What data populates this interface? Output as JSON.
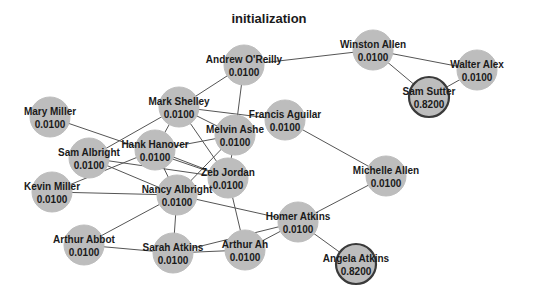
{
  "title": "initialization",
  "colors": {
    "node_fill": "#bdbdbd",
    "node_highlight_border": "#3a3a3a",
    "edge": "#555555",
    "label": "#1a1a1a",
    "background": "#ffffff"
  },
  "node_radius": 20,
  "nodes": [
    {
      "id": "andrew_oreilly",
      "name": "Andrew O'Reilly",
      "value": "0.0100",
      "x": 244,
      "y": 65,
      "highlight": false
    },
    {
      "id": "winston_allen",
      "name": "Winston Allen",
      "value": "0.0100",
      "x": 373,
      "y": 50,
      "highlight": false
    },
    {
      "id": "walter_alex",
      "name": "Walter Alex",
      "value": "0.0100",
      "x": 477,
      "y": 70,
      "highlight": false
    },
    {
      "id": "sam_sutter",
      "name": "Sam Sutter",
      "value": "0.8200",
      "x": 429,
      "y": 97,
      "highlight": true
    },
    {
      "id": "mary_miller",
      "name": "Mary Miller",
      "value": "0.0100",
      "x": 50,
      "y": 117,
      "highlight": false
    },
    {
      "id": "mark_shelley",
      "name": "Mark Shelley",
      "value": "0.0100",
      "x": 179,
      "y": 107,
      "highlight": false
    },
    {
      "id": "melvin_ashe",
      "name": "Melvin Ashe",
      "value": "0.0100",
      "x": 235,
      "y": 135,
      "highlight": false
    },
    {
      "id": "francis_aguilar",
      "name": "Francis Aguilar",
      "value": "0.0100",
      "x": 285,
      "y": 120,
      "highlight": false
    },
    {
      "id": "sam_albright",
      "name": "Sam Albright",
      "value": "0.0100",
      "x": 89,
      "y": 158,
      "highlight": false
    },
    {
      "id": "hank_hanover",
      "name": "Hank Hanover",
      "value": "0.0100",
      "x": 155,
      "y": 150,
      "highlight": false
    },
    {
      "id": "zeb_jordan",
      "name": "Zeb Jordan",
      "value": "0.0100",
      "x": 228,
      "y": 178,
      "highlight": false
    },
    {
      "id": "kevin_miller",
      "name": "Kevin Miller",
      "value": "0.0100",
      "x": 52,
      "y": 192,
      "highlight": false
    },
    {
      "id": "nancy_albright",
      "name": "Nancy Albright",
      "value": "0.0100",
      "x": 177,
      "y": 195,
      "highlight": false
    },
    {
      "id": "michelle_allen",
      "name": "Michelle Allen",
      "value": "0.0100",
      "x": 386,
      "y": 176,
      "highlight": false
    },
    {
      "id": "homer_atkins",
      "name": "Homer Atkins",
      "value": "0.0100",
      "x": 298,
      "y": 222,
      "highlight": false
    },
    {
      "id": "arthur_abbot",
      "name": "Arthur Abbot",
      "value": "0.0100",
      "x": 84,
      "y": 245,
      "highlight": false
    },
    {
      "id": "sarah_atkins",
      "name": "Sarah Atkins",
      "value": "0.0100",
      "x": 173,
      "y": 253,
      "highlight": false
    },
    {
      "id": "arthur_ah",
      "name": "Arthur Ah",
      "value": "0.0100",
      "x": 245,
      "y": 250,
      "highlight": false
    },
    {
      "id": "angela_atkins",
      "name": "Angela Atkins",
      "value": "0.8200",
      "x": 356,
      "y": 264,
      "highlight": true
    }
  ],
  "edges": [
    [
      "andrew_oreilly",
      "winston_allen"
    ],
    [
      "andrew_oreilly",
      "mark_shelley"
    ],
    [
      "andrew_oreilly",
      "melvin_ashe"
    ],
    [
      "winston_allen",
      "walter_alex"
    ],
    [
      "winston_allen",
      "sam_sutter"
    ],
    [
      "walter_alex",
      "sam_sutter"
    ],
    [
      "mark_shelley",
      "francis_aguilar"
    ],
    [
      "mark_shelley",
      "melvin_ashe"
    ],
    [
      "mark_shelley",
      "hank_hanover"
    ],
    [
      "mark_shelley",
      "zeb_jordan"
    ],
    [
      "mark_shelley",
      "sam_albright"
    ],
    [
      "mary_miller",
      "zeb_jordan"
    ],
    [
      "melvin_ashe",
      "hank_hanover"
    ],
    [
      "melvin_ashe",
      "zeb_jordan"
    ],
    [
      "melvin_ashe",
      "nancy_albright"
    ],
    [
      "sam_albright",
      "zeb_jordan"
    ],
    [
      "sam_albright",
      "nancy_albright"
    ],
    [
      "hank_hanover",
      "nancy_albright"
    ],
    [
      "hank_hanover",
      "zeb_jordan"
    ],
    [
      "hank_hanover",
      "kevin_miller"
    ],
    [
      "kevin_miller",
      "nancy_albright"
    ],
    [
      "nancy_albright",
      "homer_atkins"
    ],
    [
      "nancy_albright",
      "arthur_abbot"
    ],
    [
      "nancy_albright",
      "sarah_atkins"
    ],
    [
      "zeb_jordan",
      "arthur_ah"
    ],
    [
      "francis_aguilar",
      "michelle_allen"
    ],
    [
      "michelle_allen",
      "homer_atkins"
    ],
    [
      "homer_atkins",
      "arthur_ah"
    ],
    [
      "homer_atkins",
      "sarah_atkins"
    ],
    [
      "homer_atkins",
      "angela_atkins"
    ],
    [
      "arthur_abbot",
      "sarah_atkins"
    ],
    [
      "sarah_atkins",
      "arthur_ah"
    ]
  ]
}
